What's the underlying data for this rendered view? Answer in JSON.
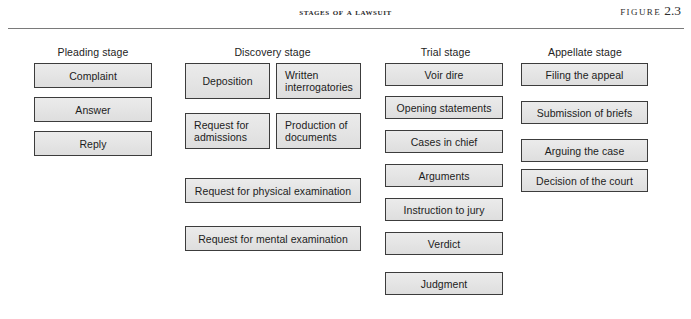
{
  "header": {
    "running_title": "Stages of a Lawsuit",
    "figure_word": "Figure",
    "figure_number": "2.3"
  },
  "columns": [
    {
      "id": "pleading",
      "heading": "Pleading stage",
      "boxes": [
        {
          "label": "Complaint",
          "align": "center"
        },
        {
          "label": "Answer",
          "align": "center"
        },
        {
          "label": "Reply",
          "align": "center"
        }
      ]
    },
    {
      "id": "discovery",
      "heading": "Discovery stage",
      "boxes": [
        {
          "label": "Deposition",
          "align": "center"
        },
        {
          "label": "Written\ninterrogatories",
          "align": "left"
        },
        {
          "label": "Request for\nadmissions",
          "align": "left"
        },
        {
          "label": "Production of\ndocuments",
          "align": "left"
        },
        {
          "label": "Request for physical examination",
          "align": "center"
        },
        {
          "label": "Request for mental examination",
          "align": "center"
        }
      ]
    },
    {
      "id": "trial",
      "heading": "Trial stage",
      "boxes": [
        {
          "label": "Voir dire",
          "align": "center"
        },
        {
          "label": "Opening statements",
          "align": "center"
        },
        {
          "label": "Cases in chief",
          "align": "center"
        },
        {
          "label": "Arguments",
          "align": "center"
        },
        {
          "label": "Instruction to jury",
          "align": "center"
        },
        {
          "label": "Verdict",
          "align": "center"
        },
        {
          "label": "Judgment",
          "align": "center"
        }
      ]
    },
    {
      "id": "appellate",
      "heading": "Appellate stage",
      "boxes": [
        {
          "label": "Filing the appeal",
          "align": "center"
        },
        {
          "label": "Submission of briefs",
          "align": "center"
        },
        {
          "label": "Arguing the case",
          "align": "center"
        },
        {
          "label": "Decision of the court",
          "align": "center"
        }
      ]
    }
  ],
  "colors": {
    "page_background": "#ffffff",
    "box_fill": "#e6e6e6",
    "box_border": "#3c3c3c",
    "box_shadow": "#9a9a9a",
    "rule": "#7a7a7a",
    "text": "#1c1c1c"
  },
  "geometry": {
    "headings": [
      {
        "id": "pleading",
        "x": 33,
        "y": 46,
        "w": 120
      },
      {
        "id": "discovery",
        "x": 185,
        "y": 46,
        "w": 175
      },
      {
        "id": "trial",
        "x": 383,
        "y": 46,
        "w": 125
      },
      {
        "id": "appellate",
        "x": 520,
        "y": 46,
        "w": 130
      }
    ],
    "boxes": [
      {
        "col": "pleading",
        "i": 0,
        "x": 34,
        "y": 63,
        "w": 118,
        "h": 25
      },
      {
        "col": "pleading",
        "i": 1,
        "x": 34,
        "y": 97,
        "w": 118,
        "h": 25
      },
      {
        "col": "pleading",
        "i": 2,
        "x": 34,
        "y": 131,
        "w": 118,
        "h": 25
      },
      {
        "col": "discovery",
        "i": 0,
        "x": 185,
        "y": 63,
        "w": 85,
        "h": 36
      },
      {
        "col": "discovery",
        "i": 1,
        "x": 276,
        "y": 63,
        "w": 85,
        "h": 36
      },
      {
        "col": "discovery",
        "i": 2,
        "x": 185,
        "y": 113,
        "w": 85,
        "h": 36
      },
      {
        "col": "discovery",
        "i": 3,
        "x": 276,
        "y": 113,
        "w": 85,
        "h": 36
      },
      {
        "col": "discovery",
        "i": 4,
        "x": 185,
        "y": 178,
        "w": 176,
        "h": 25
      },
      {
        "col": "discovery",
        "i": 5,
        "x": 185,
        "y": 226,
        "w": 176,
        "h": 25
      },
      {
        "col": "trial",
        "i": 0,
        "x": 385,
        "y": 63,
        "w": 118,
        "h": 23
      },
      {
        "col": "trial",
        "i": 1,
        "x": 385,
        "y": 96,
        "w": 118,
        "h": 23
      },
      {
        "col": "trial",
        "i": 2,
        "x": 385,
        "y": 130,
        "w": 118,
        "h": 23
      },
      {
        "col": "trial",
        "i": 3,
        "x": 385,
        "y": 164,
        "w": 118,
        "h": 23
      },
      {
        "col": "trial",
        "i": 4,
        "x": 385,
        "y": 198,
        "w": 118,
        "h": 23
      },
      {
        "col": "trial",
        "i": 5,
        "x": 385,
        "y": 232,
        "w": 118,
        "h": 23
      },
      {
        "col": "trial",
        "i": 6,
        "x": 385,
        "y": 272,
        "w": 118,
        "h": 23
      },
      {
        "col": "appellate",
        "i": 0,
        "x": 521,
        "y": 63,
        "w": 127,
        "h": 23
      },
      {
        "col": "appellate",
        "i": 1,
        "x": 521,
        "y": 101,
        "w": 127,
        "h": 23
      },
      {
        "col": "appellate",
        "i": 2,
        "x": 521,
        "y": 139,
        "w": 127,
        "h": 23
      },
      {
        "col": "appellate",
        "i": 3,
        "x": 521,
        "y": 169,
        "w": 127,
        "h": 23
      }
    ]
  }
}
